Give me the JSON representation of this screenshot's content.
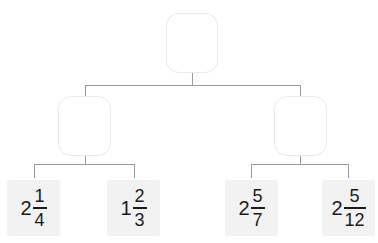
{
  "diagram": {
    "type": "binary-tree",
    "title": "",
    "colors": {
      "background": "#ffffff",
      "node_border": "#e9e9e9",
      "connector_line": "#9b9b9b",
      "leaf_background": "#f2f2f2",
      "text": "#1b1b1b"
    },
    "nodes": {
      "root": {
        "label": "",
        "empty": true
      },
      "left_child": {
        "label": "",
        "empty": true
      },
      "right_child": {
        "label": "",
        "empty": true
      }
    },
    "leaves": [
      {
        "id": "leaf-1",
        "parent": "left_child",
        "whole": "2",
        "numerator": "1",
        "denominator": "4",
        "text": "2 1/4"
      },
      {
        "id": "leaf-2",
        "parent": "left_child",
        "whole": "1",
        "numerator": "2",
        "denominator": "3",
        "text": "1 2/3"
      },
      {
        "id": "leaf-3",
        "parent": "right_child",
        "whole": "2",
        "numerator": "5",
        "denominator": "7",
        "text": "2 5/7"
      },
      {
        "id": "leaf-4",
        "parent": "right_child",
        "whole": "2",
        "numerator": "5",
        "denominator": "12",
        "text": "2 5/12"
      }
    ]
  }
}
